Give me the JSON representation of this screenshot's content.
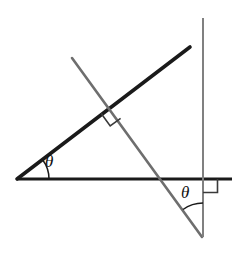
{
  "figure": {
    "background_color": "#ffffff",
    "width": 246,
    "height": 255,
    "labels": {
      "theta_left": "θ",
      "theta_right": "θ"
    },
    "colors": {
      "black_line": "#1a1a1a",
      "gray_line": "#6e6e6e",
      "vertical_line": "#808080",
      "right_angle_mark": "#3a3a3a",
      "arc": "#1a1a1a"
    },
    "elements": {
      "horizontal_baseline": "horizontal-baseline",
      "ascending_ray": "ascending-black-ray",
      "descending_transversal": "descending-gray-transversal",
      "vertical_line": "vertical-gray-line",
      "perpendicular_mark": "perpendicular-right-angle-mark",
      "base_right_angle_mark": "baseline-vertical-right-angle-mark",
      "left_angle_arc": "left-theta-arc",
      "right_angle_arc": "right-theta-arc"
    }
  },
  "chart_data": {
    "type": "diagram",
    "xlabel": "",
    "ylabel": "",
    "xlim": [
      0,
      246
    ],
    "ylim": [
      255,
      0
    ],
    "grid": false,
    "legend": "none",
    "segments": [
      {
        "name": "horizontal-baseline",
        "x1": 17,
        "y1": 179,
        "x2": 232,
        "y2": 179,
        "color": "#1a1a1a",
        "width": 3
      },
      {
        "name": "ascending-black-ray",
        "x1": 17,
        "y1": 179,
        "x2": 190,
        "y2": 47,
        "color": "#1a1a1a",
        "width": 3.6
      },
      {
        "name": "descending-gray-transversal",
        "x1": 72,
        "y1": 58,
        "x2": 202,
        "y2": 237,
        "color": "#6e6e6e",
        "width": 2.6
      },
      {
        "name": "vertical-gray-line",
        "x1": 203,
        "y1": 18,
        "x2": 203,
        "y2": 237,
        "color": "#808080",
        "width": 2.0
      }
    ],
    "right_angle_marks": [
      {
        "name": "perpendicular-right-angle-mark",
        "vertex_x": 111,
        "vertex_y": 107,
        "size": 14,
        "color": "#3a3a3a"
      },
      {
        "name": "baseline-vertical-right-angle-mark",
        "vertex_x": 203,
        "vertex_y": 179,
        "size": 14,
        "color": "#3a3a3a"
      }
    ],
    "angles": [
      {
        "name": "left-theta",
        "label": "θ",
        "vertex_x": 17,
        "vertex_y": 179,
        "radius": 32,
        "from_deg": 0,
        "to_deg": 37,
        "label_x": 52,
        "label_y": 163
      },
      {
        "name": "right-theta",
        "label": "θ",
        "vertex_x": 203,
        "vertex_y": 237,
        "radius": 34,
        "from_deg": 90,
        "to_deg": 126,
        "label_x": 188,
        "label_y": 194
      }
    ],
    "annotations": [
      "Two parallel-transversal angles both marked theta",
      "Black ray from left vertex crosses gray transversal at right angle",
      "Gray vertical line meets horizontal baseline at right angle"
    ]
  }
}
